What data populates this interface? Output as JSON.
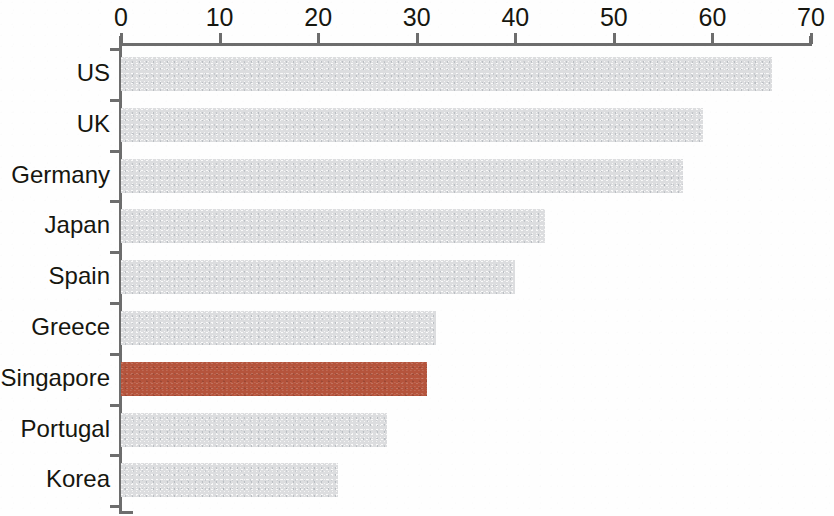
{
  "chart_data": {
    "type": "bar",
    "orientation": "horizontal",
    "title": "",
    "subtitle": "",
    "xlabel": "",
    "ylabel": "",
    "categories": [
      "US",
      "UK",
      "Germany",
      "Japan",
      "Spain",
      "Greece",
      "Singapore",
      "Portugal",
      "Korea"
    ],
    "values": [
      66,
      59,
      57,
      43,
      40,
      32,
      31,
      27,
      22
    ],
    "xlim": [
      0,
      70
    ],
    "xticks": [
      0,
      10,
      20,
      30,
      40,
      50,
      60,
      70
    ],
    "xtick_labels": [
      "0",
      "10",
      "20",
      "30",
      "40",
      "50",
      "60",
      "70"
    ],
    "grid": false,
    "legend": false,
    "bar_colors": [
      "#dcdddf",
      "#dcdddf",
      "#dcdddf",
      "#dcdddf",
      "#dcdddf",
      "#dcdddf",
      "#b5543c",
      "#dcdddf",
      "#dcdddf"
    ],
    "highlight_category": "Singapore",
    "colors": {
      "bar_default": "#dcdddf",
      "bar_highlight": "#b5543c",
      "axis": "#6d6d6d",
      "text": "#16160f",
      "background": "#fefefe"
    }
  }
}
